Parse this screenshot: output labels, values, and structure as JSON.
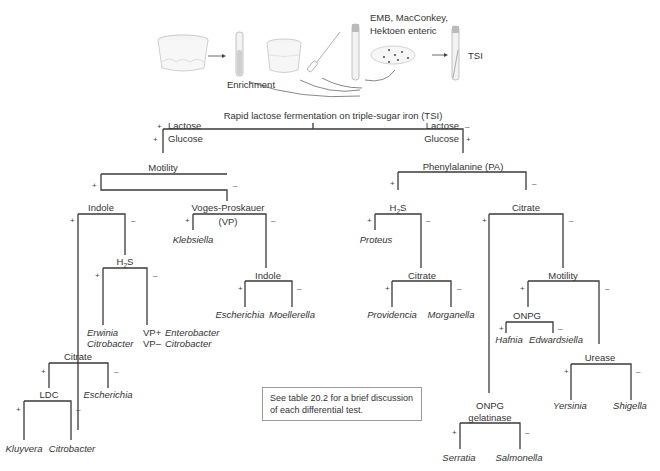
{
  "illustration": {
    "enrichment_label": "Enrichment",
    "media_label_line1": "EMB, MacConkey,",
    "media_label_line2": "Hektoen enteric",
    "tsi_label": "TSI"
  },
  "root": {
    "title": "Rapid lactose fermentation on triple-sugar iron (TSI)",
    "left": {
      "sign1": "+",
      "lactose": "Lactose",
      "sign2": "+",
      "glucose": "Glucose"
    },
    "right": {
      "lactose": "Lactose",
      "sign1": "–",
      "glucose": "Glucose",
      "sign2": "+"
    }
  },
  "left_branch": {
    "motility": "Motility",
    "indole": "Indole",
    "vp_line1": "Voges-Proskauer",
    "vp_line2": "(VP)",
    "klebsiella": "Klebsiella",
    "h2s_main": "H",
    "h2s_sub": "2",
    "h2s_end": "S",
    "erwinia": "Erwinia",
    "citrobacter1": "Citrobacter",
    "vp_plus": "VP+",
    "enterobacter": "Enterobacter",
    "vp_minus": "VP–",
    "citrobacter2": "Citrobacter",
    "indole2": "Indole",
    "escherichia1": "Escherichia",
    "moellerella": "Moellerella",
    "citrate": "Citrate",
    "escherichia2": "Escherichia",
    "ldc": "LDC",
    "kluyvera": "Kluyvera",
    "citrobacter3": "Citrobacter"
  },
  "right_branch": {
    "phenylalanine": "Phenylalanine (PA)",
    "h2s_main": "H",
    "h2s_sub": "2",
    "h2s_end": "S",
    "proteus": "Proteus",
    "citrate1": "Citrate",
    "providencia": "Providencia",
    "morganella": "Morganella",
    "citrate2": "Citrate",
    "motility": "Motility",
    "onpg": "ONPG",
    "hafnia": "Hafnia",
    "edwardsiella": "Edwardsiella",
    "urease": "Urease",
    "yersinia": "Yersinia",
    "shigella": "Shigella",
    "onpg_gel_line1": "ONPG",
    "onpg_gel_line2": "gelatinase",
    "serratia": "Serratia",
    "salmonella": "Salmonella"
  },
  "signs": {
    "plus": "+",
    "minus": "–"
  },
  "note": {
    "text": "See table 20.2 for a brief discussion of each differential test."
  }
}
